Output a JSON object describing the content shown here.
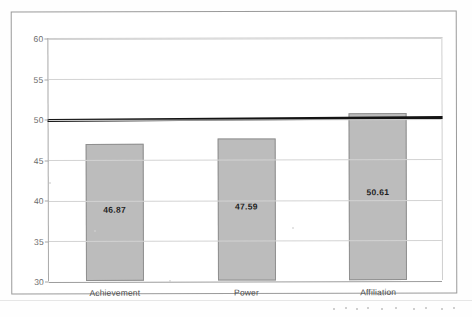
{
  "chart_data": {
    "type": "bar",
    "title": "",
    "subtitle": "",
    "xlabel": "",
    "ylabel": "",
    "categories": [
      "Achievement",
      "Power",
      "Affiliation"
    ],
    "values": [
      46.87,
      47.59,
      50.61
    ],
    "value_labels": [
      "46.87",
      "47.59",
      "50.61"
    ],
    "ylim": [
      30,
      60
    ],
    "ytick_values": [
      30,
      35,
      40,
      45,
      50,
      55,
      60
    ],
    "ytick_labels": [
      "30",
      "35",
      "40",
      "45",
      "50",
      "55",
      "60"
    ],
    "grid": true,
    "legend": "none",
    "annotations": [
      {
        "name": "reference-line",
        "type": "horizontal-line",
        "value": 50,
        "label": "",
        "color": "#141414"
      }
    ],
    "series": [
      {
        "name": "",
        "values": [
          46.87,
          47.59,
          50.61
        ],
        "color": "#bcbcbc"
      }
    ]
  },
  "colors": {
    "bar_fill": "#bcbcbc",
    "bar_border": "#8f8f8f",
    "gridline": "#d3d3d3",
    "axis": "#a8a8a8",
    "reference_line": "#141414",
    "tick_text": "#6b6b6b",
    "category_text": "#4e4e4e",
    "value_text": "#1d1d1d",
    "frame": "#9a9a9a",
    "background": "#ffffff"
  },
  "frame": {
    "border_label": "chart-outer-border"
  },
  "icons": {
    "scan_noise": "scan-artifact"
  }
}
